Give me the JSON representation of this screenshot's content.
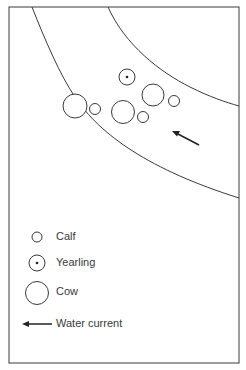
{
  "diagram": {
    "type": "schematic map of animal positions in a river channel",
    "colors": {
      "stroke": "#3a3a3a",
      "background": "#ffffff"
    },
    "frame": {
      "x": 9,
      "y": 7,
      "width": 230,
      "height": 356
    },
    "riverbanks": [
      {
        "name": "left-bank",
        "points": [
          [
            32,
            7
          ],
          [
            56,
            60
          ],
          [
            72,
            92
          ],
          [
            85,
            115
          ],
          [
            110,
            140
          ],
          [
            140,
            160
          ],
          [
            180,
            180
          ],
          [
            239,
            198
          ]
        ]
      },
      {
        "name": "right-bank",
        "points": [
          [
            108,
            7
          ],
          [
            120,
            30
          ],
          [
            140,
            55
          ],
          [
            170,
            75
          ],
          [
            200,
            92
          ],
          [
            239,
            106
          ]
        ]
      }
    ],
    "animals": [
      {
        "kind": "cow",
        "cx": 75,
        "cy": 106,
        "r": 12
      },
      {
        "kind": "calf",
        "cx": 95,
        "cy": 109,
        "r": 5.5
      },
      {
        "kind": "yearling",
        "cx": 127,
        "cy": 77,
        "r": 8
      },
      {
        "kind": "cow",
        "cx": 123,
        "cy": 112,
        "r": 11.5
      },
      {
        "kind": "calf",
        "cx": 143,
        "cy": 117,
        "r": 5.5
      },
      {
        "kind": "cow",
        "cx": 153,
        "cy": 95,
        "r": 11
      },
      {
        "kind": "calf",
        "cx": 174,
        "cy": 101,
        "r": 5.5
      }
    ],
    "current_arrow": {
      "from": [
        199,
        145
      ],
      "to": [
        174,
        132
      ]
    }
  },
  "legend": {
    "items": [
      {
        "symbol": "calf",
        "label": "Calf"
      },
      {
        "symbol": "yearling",
        "label": "Yearling"
      },
      {
        "symbol": "cow",
        "label": "Cow"
      },
      {
        "symbol": "arrow",
        "label": "Water current"
      }
    ]
  }
}
